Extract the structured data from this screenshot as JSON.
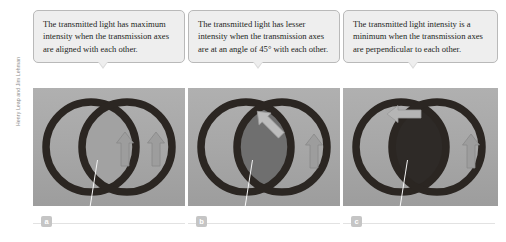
{
  "figure": {
    "credit": "Henry Leap and Jim Lehman",
    "background_color": "#ffffff",
    "callout_fill": "#eeeeee",
    "callout_border": "#b9b9b9",
    "photo_background": "#a8a8a8",
    "ring_color": "#2b2622",
    "arrow_color": "#9a9a9a"
  },
  "panels": [
    {
      "id": "a",
      "label": "a",
      "caption": "The transmitted light has maximum intensity when the transmission axes are aligned with each other.",
      "overlap_shade": "#a2a2a2",
      "arrows": [
        {
          "name": "arrow-left-vertical",
          "angle_deg": 0
        },
        {
          "name": "arrow-right-vertical",
          "angle_deg": 0
        }
      ]
    },
    {
      "id": "b",
      "label": "b",
      "caption": "The transmitted light has lesser intensity when the transmission axes are at an angle of 45° with each other.",
      "overlap_shade": "#6f6f6f",
      "arrows": [
        {
          "name": "arrow-left-diagonal-45",
          "angle_deg": -45
        },
        {
          "name": "arrow-right-vertical",
          "angle_deg": 0
        }
      ]
    },
    {
      "id": "c",
      "label": "c",
      "caption": "The transmitted light intensity is a minimum when the transmission axes are perpendicular to each other.",
      "overlap_shade": "#2e2a27",
      "arrows": [
        {
          "name": "arrow-left-horizontal",
          "angle_deg": -90
        },
        {
          "name": "arrow-right-vertical",
          "angle_deg": 0
        }
      ]
    }
  ]
}
